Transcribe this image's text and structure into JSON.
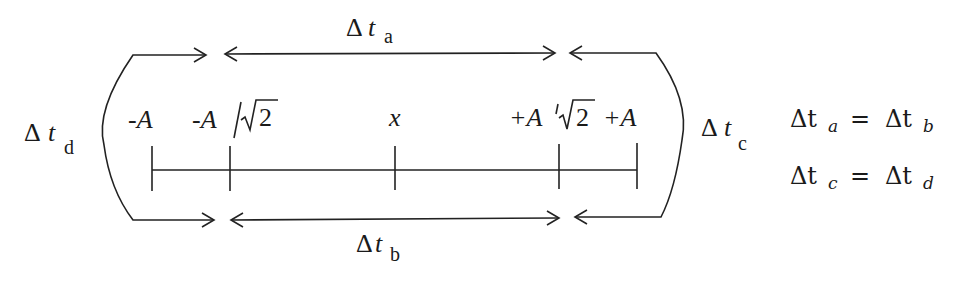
{
  "diagram": {
    "axis_labels": {
      "neg_a": "-A",
      "neg_a_root2_num": "-A",
      "neg_a_root2_den": "2",
      "center": "x",
      "pos_a_root2_num": "+A",
      "pos_a_root2_den": "2",
      "pos_a": "+A"
    },
    "intervals": {
      "a": {
        "delta": "Δ",
        "t": "t",
        "sub": "a"
      },
      "b": {
        "delta": "Δ",
        "t": "t",
        "sub": "b"
      },
      "c": {
        "delta": "Δ",
        "t": "t",
        "sub": "c"
      },
      "d": {
        "delta": "Δ",
        "t": "t",
        "sub": "d"
      }
    },
    "equations": [
      {
        "lhs_delta": "Δt",
        "lhs_sub": "a",
        "op": "=",
        "rhs_delta": "Δt",
        "rhs_sub": "b"
      },
      {
        "lhs_delta": "Δt",
        "lhs_sub": "c",
        "op": "=",
        "rhs_delta": "Δt",
        "rhs_sub": "d"
      }
    ],
    "colors": {
      "ink": "#222222",
      "background": "#ffffff"
    }
  }
}
